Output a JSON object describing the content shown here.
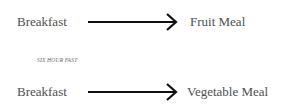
{
  "diagram": {
    "rows": [
      {
        "from": "Breakfast",
        "to": "Fruit Meal"
      },
      {
        "from": "Breakfast",
        "to": "Vegetable Meal"
      }
    ],
    "note": "SIX HOUR FAST",
    "arrow_color": "#111111",
    "text_color": "#4f4f4f"
  }
}
